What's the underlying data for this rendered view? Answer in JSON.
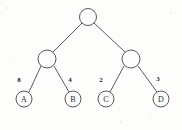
{
  "diagram": {
    "type": "binary-tree",
    "background_color": "#fdfdfc",
    "stroke_color": "#454545",
    "text_color": "#2b2b2b",
    "nodes": [
      {
        "id": "root",
        "label": "",
        "cx": 88,
        "cy": 17,
        "r": 8.5,
        "kind": "internal"
      },
      {
        "id": "left",
        "label": "",
        "cx": 47,
        "cy": 59,
        "r": 9.0,
        "kind": "internal"
      },
      {
        "id": "right",
        "label": "",
        "cx": 131,
        "cy": 59,
        "r": 9.0,
        "kind": "internal"
      },
      {
        "id": "leafA",
        "label": "A",
        "cx": 24,
        "cy": 99,
        "r": 8.0,
        "kind": "leaf"
      },
      {
        "id": "leafB",
        "label": "B",
        "cx": 73,
        "cy": 99,
        "r": 8.0,
        "kind": "leaf"
      },
      {
        "id": "leafC",
        "label": "C",
        "cx": 106,
        "cy": 99,
        "r": 8.0,
        "kind": "leaf"
      },
      {
        "id": "leafD",
        "label": "D",
        "cx": 161,
        "cy": 99,
        "r": 8.0,
        "kind": "leaf"
      }
    ],
    "edges": [
      {
        "id": "root-left",
        "from": "root",
        "to": "left",
        "x1": 82,
        "y1": 23,
        "x2": 53,
        "y2": 52,
        "weight": ""
      },
      {
        "id": "root-right",
        "from": "root",
        "to": "right",
        "x1": 94,
        "y1": 23,
        "x2": 125,
        "y2": 52,
        "weight": ""
      },
      {
        "id": "left-leafA",
        "from": "left",
        "to": "leafA",
        "x1": 41,
        "y1": 66,
        "x2": 29,
        "y2": 92,
        "weight": "8"
      },
      {
        "id": "left-leafB",
        "from": "left",
        "to": "leafB",
        "x1": 54,
        "y1": 66,
        "x2": 69,
        "y2": 92,
        "weight": "4"
      },
      {
        "id": "right-leafC",
        "from": "right",
        "to": "leafC",
        "x1": 124,
        "y1": 66,
        "x2": 110,
        "y2": 92,
        "weight": "2"
      },
      {
        "id": "right-leafD",
        "from": "right",
        "to": "leafD",
        "x1": 138,
        "y1": 66,
        "x2": 157,
        "y2": 92,
        "weight": "3"
      }
    ],
    "edge_weights": [
      {
        "id": "weight-a",
        "value": "8",
        "x": 19,
        "y": 80,
        "edge": "left-leafA"
      },
      {
        "id": "weight-b",
        "value": "4",
        "x": 70,
        "y": 80,
        "edge": "left-leafB"
      },
      {
        "id": "weight-c",
        "value": "2",
        "x": 101,
        "y": 80,
        "edge": "right-leafC"
      },
      {
        "id": "weight-d",
        "value": "3",
        "x": 158,
        "y": 79,
        "edge": "right-leafD"
      }
    ],
    "leaf_labels": {
      "a": "A",
      "b": "B",
      "c": "C",
      "d": "D"
    }
  }
}
